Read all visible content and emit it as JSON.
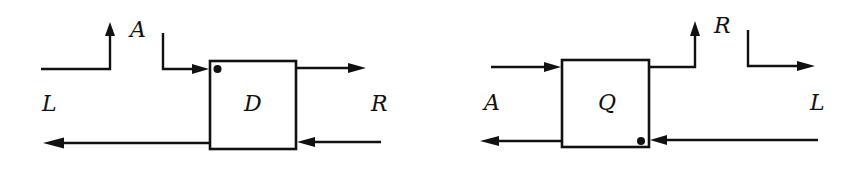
{
  "diagrams": [
    {
      "name": "D",
      "box_label": "D",
      "labels": {
        "left": "L",
        "top": "A",
        "right": "R"
      },
      "connections": [
        {
          "from": "L",
          "to": "A",
          "description": "L input turns up toward A"
        },
        {
          "from": "A",
          "to": "D",
          "description": "A input enters D at top-left (marked with dot)"
        },
        {
          "from": "D",
          "to": "R",
          "description": "D output to R (top)"
        },
        {
          "from": "R",
          "to": "D",
          "description": "R input enters D (bottom)"
        },
        {
          "from": "D",
          "to": "L",
          "description": "D output to L (bottom)"
        }
      ]
    },
    {
      "name": "Q",
      "box_label": "Q",
      "labels": {
        "left": "A",
        "top": "R",
        "right": "L"
      },
      "connections": [
        {
          "from": "A",
          "to": "Q",
          "description": "A input enters Q (top)"
        },
        {
          "from": "Q",
          "to": "R",
          "description": "Q output turns up toward R"
        },
        {
          "from": "R",
          "to": "L",
          "description": "R turns right toward L"
        },
        {
          "from": "L",
          "to": "Q",
          "description": "L input enters Q at bottom-right (marked with dot)"
        },
        {
          "from": "Q",
          "to": "A",
          "description": "Q output to A (bottom)"
        }
      ]
    }
  ]
}
